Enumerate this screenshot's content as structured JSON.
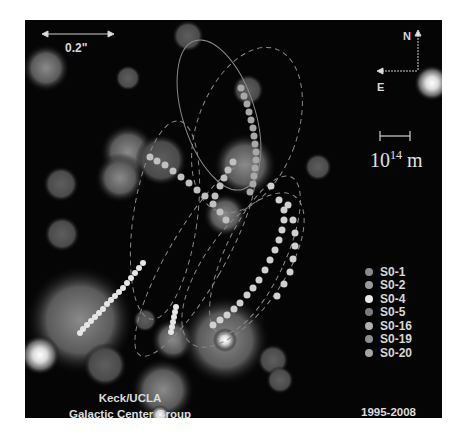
{
  "image": {
    "subject": "Orbits of stars around the Galactic Center black hole",
    "scale_bar_angular": "0.2\"",
    "scale_bar_physical": {
      "base": "10",
      "exponent": "14",
      "unit": "m"
    },
    "compass": {
      "north": "N",
      "east": "E"
    },
    "legend": [
      {
        "label": "S0-1",
        "color": "#8a8a8a"
      },
      {
        "label": "S0-2",
        "color": "#9a9a9a"
      },
      {
        "label": "S0-4",
        "color": "#e8e8e8"
      },
      {
        "label": "S0-5",
        "color": "#7a7a7a"
      },
      {
        "label": "S0-16",
        "color": "#b0b0b0"
      },
      {
        "label": "S0-19",
        "color": "#8e8e8e"
      },
      {
        "label": "S0-20",
        "color": "#a4a4a4"
      }
    ],
    "credit_line1": "Keck/UCLA",
    "credit_line2": "Galactic Center Group",
    "years": "1995-2008"
  }
}
